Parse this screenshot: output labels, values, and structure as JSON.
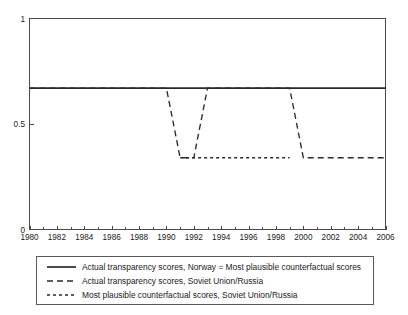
{
  "chart_data": {
    "type": "line",
    "title": "",
    "xlabel": "",
    "ylabel": "",
    "xlim": [
      1980,
      2006
    ],
    "ylim": [
      0,
      1
    ],
    "grid": false,
    "legend_position": "below",
    "y_ticks": [
      "0",
      "0.5",
      "1"
    ],
    "y_tick_values": [
      0,
      0.5,
      1
    ],
    "x_ticks": [
      "1980",
      "1982",
      "1984",
      "1986",
      "1988",
      "1990",
      "1992",
      "1994",
      "1996",
      "1998",
      "2000",
      "2002",
      "2004",
      "2006"
    ],
    "x_tick_values": [
      1980,
      1982,
      1984,
      1986,
      1988,
      1990,
      1992,
      1994,
      1996,
      1998,
      2000,
      2002,
      2004,
      2006
    ],
    "x_minor_tick_values": [
      1981,
      1983,
      1985,
      1987,
      1989,
      1991,
      1993,
      1995,
      1997,
      1999,
      2001,
      2003,
      2005
    ],
    "series": [
      {
        "name": "Actual transparency scores, Norway = Most plausible counterfactual scores",
        "style": "solid",
        "color": "#2a2a2a",
        "x": [
          1980,
          2006
        ],
        "values": [
          0.67,
          0.67
        ]
      },
      {
        "name": "Actual transparency scores, Soviet Union/Russia",
        "style": "dashed",
        "color": "#2a2a2a",
        "x": [
          1980,
          1990,
          1991,
          1992,
          1993,
          1999,
          2000,
          2006
        ],
        "values": [
          0.67,
          0.67,
          0.34,
          0.34,
          0.67,
          0.67,
          0.34,
          0.34
        ]
      },
      {
        "name": "Most plausible counterfactual scores, Soviet Union/Russia",
        "style": "dotted",
        "color": "#2a2a2a",
        "x": [
          1991,
          1999
        ],
        "values": [
          0.34,
          0.34
        ]
      }
    ]
  },
  "legend": {
    "entries": [
      {
        "label": "Actual transparency scores, Norway = Most plausible counterfactual scores",
        "style": "solid"
      },
      {
        "label": "Actual transparency scores, Soviet Union/Russia",
        "style": "dashed"
      },
      {
        "label": "Most plausible counterfactual scores, Soviet Union/Russia",
        "style": "dotted"
      }
    ]
  },
  "axes": {
    "y_top_label": "1",
    "y_mid_label": "0.5",
    "y_bottom_label": "0",
    "x_labels": [
      "1980",
      "1982",
      "1984",
      "1986",
      "1988",
      "1990",
      "1992",
      "1994",
      "1996",
      "1998",
      "2000",
      "2002",
      "2004",
      "2006"
    ]
  },
  "colors": {
    "line": "#2a2a2a",
    "axis": "#4a4a4a",
    "background": "#ffffff",
    "legend_border": "#5a5a5a"
  }
}
